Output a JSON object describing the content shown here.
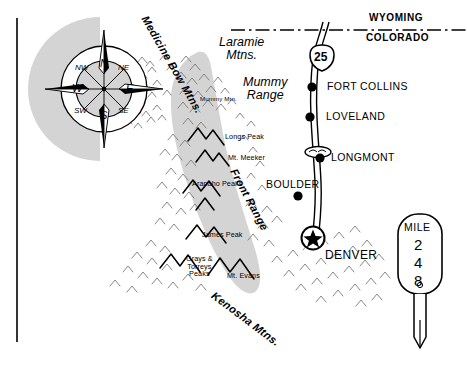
{
  "map": {
    "title": "Colorado Front Range Reference Map",
    "colors": {
      "shade_gray": "#d4d4d4",
      "line_black": "#000000",
      "paper_white": "#ffffff"
    },
    "states": [
      {
        "name": "WYOMING",
        "position": "above-border"
      },
      {
        "name": "COLORADO",
        "position": "below-border"
      }
    ],
    "highway": {
      "shield_label": "25",
      "shield_type": "interstate"
    },
    "cities": [
      {
        "name": "FORT COLLINS",
        "symbol": "dot",
        "x": 312,
        "y": 87
      },
      {
        "name": "LOVELAND",
        "symbol": "dot",
        "x": 310,
        "y": 117
      },
      {
        "name": "LONGMONT",
        "symbol": "dot-interchange",
        "x": 320,
        "y": 158
      },
      {
        "name": "BOULDER",
        "symbol": "dot",
        "x": 298,
        "y": 195
      },
      {
        "name": "DENVER",
        "symbol": "star-capital",
        "x": 313,
        "y": 238
      }
    ],
    "mountain_ranges": [
      {
        "name": "Medicine Bow Mtns.",
        "style": "rotated-diagonal"
      },
      {
        "name": "Laramie\nMtns.",
        "style": "italic-upright"
      },
      {
        "name": "Mummy\nRange",
        "style": "italic-upright"
      },
      {
        "name": "Front Range",
        "style": "rotated-diagonal"
      },
      {
        "name": "Kenosha Mtns.",
        "style": "rotated-diagonal"
      }
    ],
    "peaks": [
      {
        "name": "Mummy Mtn.",
        "x": 200,
        "y": 99
      },
      {
        "name": "Longs Peak",
        "x": 225,
        "y": 136
      },
      {
        "name": "Mt. Meeker",
        "x": 228,
        "y": 157
      },
      {
        "name": "Arapaho Peaks",
        "x": 192,
        "y": 183
      },
      {
        "name": "James Peak",
        "x": 202,
        "y": 234
      },
      {
        "name": "Grays &\nTorreys\nPeaks",
        "x": 186,
        "y": 258
      },
      {
        "name": "Mt. Evans",
        "x": 227,
        "y": 274
      }
    ],
    "compass": {
      "cardinals": [
        "N",
        "E",
        "S",
        "W"
      ],
      "intercardinals": [
        "NW",
        "NE",
        "SW",
        "SE"
      ]
    },
    "mile_marker": {
      "heading": "MILE",
      "digits": [
        "2",
        "4",
        "8"
      ]
    }
  }
}
